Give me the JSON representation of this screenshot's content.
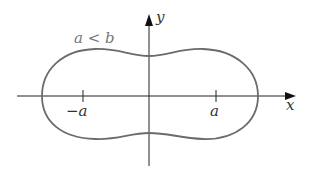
{
  "diagram": {
    "type": "cassini-oval-like closed curve",
    "condition_label": "a < b",
    "axes": {
      "x_label": "x",
      "y_label": "y"
    },
    "ticks": [
      {
        "name": "tick-neg-a",
        "label": "−a"
      },
      {
        "name": "tick-pos-a",
        "label": "a"
      }
    ],
    "colors": {
      "curve": "#6b6b6b",
      "axes": "#222222",
      "condition_text": "#777777",
      "text": "#333333"
    }
  }
}
